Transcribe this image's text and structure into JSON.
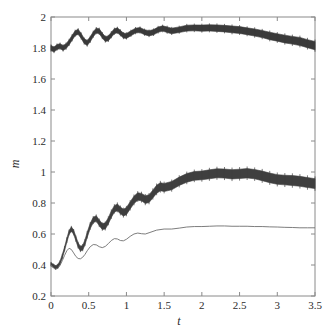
{
  "figure": {
    "background": "#ffffff",
    "plot_frame_color": "#8a8a8a",
    "width": 335,
    "height": 336
  },
  "axes": {
    "x_title": "t",
    "y_title": "m",
    "x_ticks": [
      "0",
      "0.5",
      "1",
      "1.5",
      "2",
      "2.5",
      "3",
      "3.5"
    ],
    "y_ticks": [
      "0.2",
      "0.4",
      "0.6",
      "0.8",
      "1",
      "1.2",
      "1.4",
      "1.6",
      "1.8",
      "2"
    ]
  },
  "chart_data": {
    "type": "line",
    "title": "",
    "xlabel": "t",
    "ylabel": "m",
    "xlim": [
      0,
      3.5
    ],
    "ylim": [
      0.2,
      2
    ],
    "xticks": [
      0,
      0.5,
      1,
      1.5,
      2,
      2.5,
      3,
      3.5
    ],
    "yticks": [
      0.2,
      0.4,
      0.6,
      0.8,
      1.0,
      1.2,
      1.4,
      1.6,
      1.8,
      2.0
    ],
    "grid": false,
    "legend": "none",
    "colors": {
      "upper_band": "#3a3a3a",
      "middle_band": "#3f3f3f",
      "thin_line": "#6e6e6e"
    },
    "series": [
      {
        "name": "upper-band",
        "style": "errorbar-band",
        "color": "#3a3a3a",
        "x": [
          0.0,
          0.04,
          0.08,
          0.12,
          0.16,
          0.2,
          0.24,
          0.28,
          0.32,
          0.36,
          0.4,
          0.44,
          0.48,
          0.52,
          0.56,
          0.6,
          0.64,
          0.68,
          0.72,
          0.76,
          0.8,
          0.84,
          0.88,
          0.92,
          0.96,
          1.0,
          1.06,
          1.12,
          1.18,
          1.24,
          1.3,
          1.36,
          1.42,
          1.48,
          1.54,
          1.6,
          1.7,
          1.8,
          1.9,
          2.0,
          2.1,
          2.2,
          2.3,
          2.4,
          2.5,
          2.6,
          2.7,
          2.8,
          2.9,
          3.0,
          3.1,
          3.2,
          3.3,
          3.4,
          3.5
        ],
        "values": [
          1.8,
          1.79,
          1.806,
          1.812,
          1.8,
          1.812,
          1.836,
          1.866,
          1.895,
          1.905,
          1.878,
          1.845,
          1.832,
          1.856,
          1.889,
          1.912,
          1.908,
          1.88,
          1.858,
          1.862,
          1.886,
          1.908,
          1.914,
          1.898,
          1.88,
          1.878,
          1.895,
          1.912,
          1.916,
          1.902,
          1.895,
          1.902,
          1.918,
          1.926,
          1.918,
          1.91,
          1.918,
          1.928,
          1.93,
          1.928,
          1.93,
          1.928,
          1.925,
          1.92,
          1.916,
          1.908,
          1.9,
          1.89,
          1.878,
          1.868,
          1.858,
          1.85,
          1.842,
          1.828,
          1.815
        ],
        "err": [
          0.016,
          0.016,
          0.016,
          0.016,
          0.016,
          0.016,
          0.016,
          0.016,
          0.016,
          0.016,
          0.016,
          0.016,
          0.016,
          0.016,
          0.016,
          0.016,
          0.016,
          0.016,
          0.016,
          0.016,
          0.016,
          0.016,
          0.016,
          0.016,
          0.016,
          0.016,
          0.016,
          0.016,
          0.016,
          0.016,
          0.017,
          0.017,
          0.017,
          0.017,
          0.018,
          0.018,
          0.018,
          0.019,
          0.019,
          0.02,
          0.02,
          0.021,
          0.021,
          0.022,
          0.022,
          0.022,
          0.023,
          0.023,
          0.024,
          0.024,
          0.025,
          0.025,
          0.026,
          0.026,
          0.027
        ]
      },
      {
        "name": "middle-band",
        "style": "errorbar-band",
        "color": "#3f3f3f",
        "x": [
          0.0,
          0.03,
          0.06,
          0.09,
          0.12,
          0.15,
          0.18,
          0.21,
          0.24,
          0.27,
          0.3,
          0.33,
          0.36,
          0.39,
          0.42,
          0.45,
          0.48,
          0.52,
          0.56,
          0.6,
          0.64,
          0.68,
          0.72,
          0.76,
          0.8,
          0.84,
          0.88,
          0.92,
          0.96,
          1.0,
          1.05,
          1.1,
          1.15,
          1.2,
          1.25,
          1.3,
          1.35,
          1.4,
          1.45,
          1.5,
          1.6,
          1.7,
          1.8,
          1.9,
          2.0,
          2.1,
          2.2,
          2.3,
          2.4,
          2.5,
          2.6,
          2.7,
          2.8,
          2.9,
          3.0,
          3.1,
          3.2,
          3.3,
          3.4,
          3.5
        ],
        "values": [
          0.405,
          0.395,
          0.385,
          0.392,
          0.415,
          0.455,
          0.505,
          0.56,
          0.61,
          0.632,
          0.612,
          0.57,
          0.528,
          0.505,
          0.512,
          0.545,
          0.595,
          0.652,
          0.69,
          0.7,
          0.672,
          0.648,
          0.652,
          0.685,
          0.728,
          0.762,
          0.772,
          0.752,
          0.738,
          0.748,
          0.785,
          0.82,
          0.842,
          0.838,
          0.822,
          0.828,
          0.858,
          0.888,
          0.905,
          0.9,
          0.912,
          0.94,
          0.962,
          0.975,
          0.978,
          0.985,
          0.992,
          0.99,
          0.985,
          0.988,
          0.992,
          0.986,
          0.975,
          0.962,
          0.952,
          0.948,
          0.945,
          0.94,
          0.932,
          0.925
        ],
        "err": [
          0.01,
          0.01,
          0.01,
          0.011,
          0.011,
          0.012,
          0.012,
          0.013,
          0.013,
          0.014,
          0.014,
          0.014,
          0.015,
          0.015,
          0.016,
          0.016,
          0.017,
          0.017,
          0.018,
          0.018,
          0.019,
          0.019,
          0.02,
          0.02,
          0.021,
          0.021,
          0.022,
          0.022,
          0.022,
          0.023,
          0.023,
          0.024,
          0.024,
          0.024,
          0.025,
          0.025,
          0.025,
          0.026,
          0.026,
          0.026,
          0.027,
          0.027,
          0.028,
          0.028,
          0.028,
          0.029,
          0.029,
          0.029,
          0.03,
          0.03,
          0.03,
          0.03,
          0.031,
          0.031,
          0.031,
          0.031,
          0.032,
          0.032,
          0.032,
          0.032
        ]
      },
      {
        "name": "thin-line",
        "style": "line",
        "color": "#6e6e6e",
        "x": [
          0.0,
          0.03,
          0.06,
          0.09,
          0.12,
          0.15,
          0.18,
          0.21,
          0.24,
          0.27,
          0.3,
          0.33,
          0.36,
          0.39,
          0.42,
          0.45,
          0.48,
          0.52,
          0.56,
          0.6,
          0.64,
          0.68,
          0.72,
          0.76,
          0.8,
          0.84,
          0.88,
          0.92,
          0.96,
          1.0,
          1.05,
          1.1,
          1.15,
          1.2,
          1.25,
          1.3,
          1.4,
          1.5,
          1.6,
          1.7,
          1.8,
          1.9,
          2.0,
          2.1,
          2.2,
          2.3,
          2.4,
          2.5,
          2.6,
          2.7,
          2.8,
          2.9,
          3.0,
          3.1,
          3.2,
          3.3,
          3.4,
          3.5
        ],
        "values": [
          0.4,
          0.382,
          0.372,
          0.378,
          0.398,
          0.428,
          0.462,
          0.492,
          0.508,
          0.5,
          0.478,
          0.455,
          0.442,
          0.44,
          0.45,
          0.468,
          0.492,
          0.518,
          0.532,
          0.53,
          0.518,
          0.512,
          0.52,
          0.538,
          0.558,
          0.57,
          0.568,
          0.558,
          0.556,
          0.566,
          0.585,
          0.6,
          0.606,
          0.602,
          0.6,
          0.608,
          0.625,
          0.632,
          0.632,
          0.638,
          0.645,
          0.648,
          0.648,
          0.65,
          0.652,
          0.652,
          0.65,
          0.65,
          0.65,
          0.648,
          0.648,
          0.646,
          0.645,
          0.643,
          0.642,
          0.64,
          0.64,
          0.64
        ]
      }
    ]
  }
}
